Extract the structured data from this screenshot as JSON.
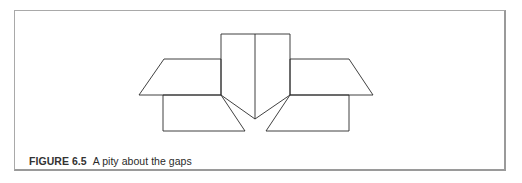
{
  "figure": {
    "label": "FIGURE 6.5",
    "title": "A pity about the gaps"
  },
  "diagram": {
    "stroke_color": "#2b2b2b",
    "shapes": [
      {
        "name": "center-rectangle",
        "points": "221,34 290,34 290,95 255,119 221,95"
      },
      {
        "name": "center-divider",
        "points": "255,34 255,119"
      },
      {
        "name": "left-trapezoid",
        "points": "164,59 221,59 221,95 139,95"
      },
      {
        "name": "right-trapezoid",
        "points": "290,59 349,59 373,95 290,95"
      },
      {
        "name": "left-lower-box",
        "points": "163,95 221,95 245,131 163,131"
      },
      {
        "name": "right-lower-box",
        "points": "290,95 349,95 349,131 266,131"
      }
    ]
  }
}
